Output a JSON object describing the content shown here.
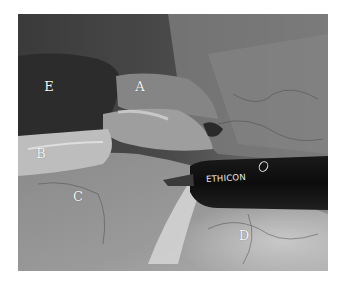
{
  "figure": {
    "labels": [
      {
        "id": "E",
        "text": "E",
        "x": 49,
        "y": 86
      },
      {
        "id": "A",
        "text": "A",
        "x": 140,
        "y": 86
      },
      {
        "id": "B",
        "text": "B",
        "x": 41,
        "y": 153
      },
      {
        "id": "C",
        "text": "C",
        "x": 78,
        "y": 196
      },
      {
        "id": "D",
        "text": "D",
        "x": 244,
        "y": 235
      }
    ],
    "instrument": {
      "brand_text": "ETHICON"
    }
  }
}
